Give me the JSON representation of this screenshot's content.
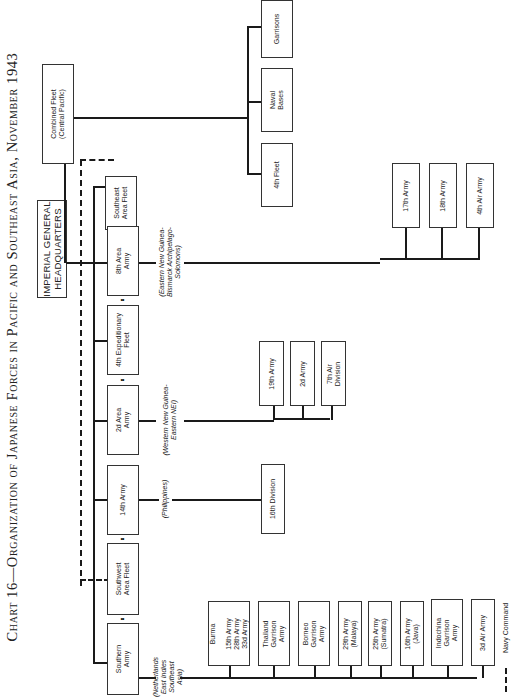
{
  "title": "Chart 16—Organization of Japanese Forces in Pacific and Southeast Asia, November 1943",
  "headquarters": {
    "label": "IMPERIAL GENERAL\nHEADQUARTERS"
  },
  "combined_fleet": {
    "label": "Combined Fleet\n(Central Pacific)",
    "subordinates": [
      "4th Fleet",
      "Naval\nBases",
      "Garrisons"
    ]
  },
  "theater_commands": [
    {
      "label": "Southeast\nArea Fleet"
    },
    {
      "label": "8th Area\nArmy",
      "region": "(Eastern New Guinea-\nBismarck Archipelago-\nSolomons)",
      "subordinates": [
        "17th Army",
        "18th Army",
        "4th Air Army"
      ]
    },
    {
      "label": "4th Expeditionary\nFleet"
    },
    {
      "label": "2d Area\nArmy",
      "region": "(Western New Guinea-\nEastern NEI)",
      "subordinates": [
        "19th Army",
        "2d Army",
        "7th Air\nDivision"
      ]
    },
    {
      "label": "14th Army",
      "region": "(Philippines)",
      "subordinates": [
        "16th Division"
      ]
    },
    {
      "label": "Southwest\nArea Fleet"
    },
    {
      "label": "Southern\nArmy",
      "region": "(Netherlands\nEast Indies\nSoutheast\nAsia)",
      "subordinates": [
        "Burma\n\n15th Army\n28th Army\n33d Army",
        "Thailand\nGarrison\nArmy",
        "Borneo\nGarrison\nArmy",
        "29th Army\n(Malaya)",
        "25th Army\n(Sumatra)",
        "16th Army\n(Java)",
        "Indochina\nGarrison\nArmy",
        "3d Air Army"
      ]
    }
  ],
  "legend": {
    "label": "Navy Command",
    "style": "dashed"
  },
  "colors": {
    "line": "#1a1a1a",
    "box_border": "#333333",
    "background": "#ffffff"
  }
}
